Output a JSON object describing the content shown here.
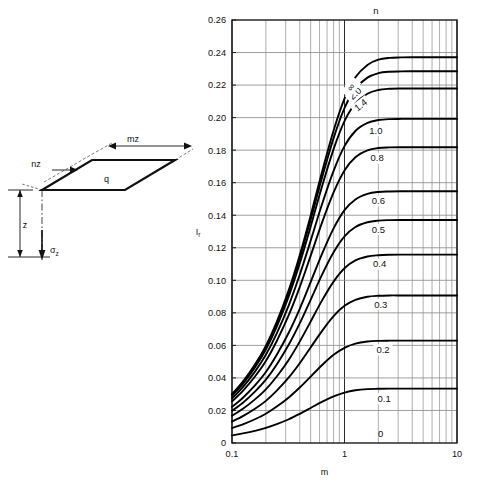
{
  "figure": {
    "type": "influence-chart",
    "sketch": {
      "label_q": "q",
      "label_mz": "mz",
      "label_nz": "nz",
      "label_z": "z",
      "label_sigma": "σ",
      "label_sigma_sub": "z"
    },
    "chart_title_top": "n"
  },
  "chart_data": {
    "type": "line",
    "title": "",
    "subtitle": "",
    "xlabel": "m",
    "ylabel": "I",
    "ylabel_sub": "r",
    "xscale": "log",
    "xlim": [
      0.1,
      10
    ],
    "ylim": [
      0,
      0.26
    ],
    "grid": true,
    "legend_position": "inline-curve-labels",
    "legend_title": "n",
    "xticks": [
      0.1,
      1,
      10
    ],
    "xtick_labels": [
      "0.1",
      "1",
      "10"
    ],
    "x_minor_ticks": [
      0.2,
      0.3,
      0.4,
      0.5,
      0.6,
      0.7,
      0.8,
      0.9,
      2,
      3,
      4,
      5,
      6,
      7,
      8,
      9
    ],
    "yticks": [
      0,
      0.02,
      0.04,
      0.06,
      0.08,
      0.1,
      0.12,
      0.14,
      0.16,
      0.18,
      0.2,
      0.22,
      0.24,
      0.26
    ],
    "ytick_labels": [
      "0",
      "0.02",
      "0.04",
      "0.06",
      "0.08",
      "0.10",
      "0.12",
      "0.14",
      "0.16",
      "0.18",
      "0.20",
      "0.22",
      "0.24",
      "0.26"
    ],
    "x": [
      0.1,
      0.125,
      0.16,
      0.2,
      0.25,
      0.32,
      0.4,
      0.5,
      0.63,
      0.8,
      1.0,
      1.25,
      1.6,
      2.0,
      2.5,
      3.2,
      4.0,
      5.0,
      6.3,
      8.0,
      10.0
    ],
    "series": [
      {
        "name": "0.1",
        "label": "0.1",
        "values": [
          0.0047,
          0.0059,
          0.0075,
          0.0093,
          0.0116,
          0.0146,
          0.0179,
          0.0215,
          0.0253,
          0.0287,
          0.031,
          0.0324,
          0.0331,
          0.0333,
          0.0334,
          0.0334,
          0.0334,
          0.0334,
          0.0334,
          0.0334,
          0.0334
        ]
      },
      {
        "name": "0.2",
        "label": "0.2",
        "values": [
          0.0092,
          0.0115,
          0.0146,
          0.018,
          0.0224,
          0.028,
          0.0341,
          0.0408,
          0.0478,
          0.0542,
          0.0585,
          0.0611,
          0.0624,
          0.0628,
          0.0629,
          0.0629,
          0.0629,
          0.0629,
          0.0629,
          0.0629,
          0.0629
        ]
      },
      {
        "name": "0.3",
        "label": "0.3",
        "values": [
          0.0132,
          0.0165,
          0.021,
          0.0259,
          0.0322,
          0.0403,
          0.049,
          0.0587,
          0.0688,
          0.078,
          0.0843,
          0.088,
          0.0899,
          0.0905,
          0.0907,
          0.0907,
          0.0907,
          0.0907,
          0.0907,
          0.0907,
          0.0907
        ]
      },
      {
        "name": "0.4",
        "label": "0.4",
        "values": [
          0.0168,
          0.021,
          0.0268,
          0.033,
          0.0409,
          0.0512,
          0.0623,
          0.0746,
          0.0875,
          0.0992,
          0.1074,
          0.1122,
          0.1146,
          0.1154,
          0.1157,
          0.1158,
          0.1158,
          0.1158,
          0.1158,
          0.1158,
          0.1158
        ]
      },
      {
        "name": "0.5",
        "label": "0.5",
        "values": [
          0.0198,
          0.0248,
          0.0316,
          0.0389,
          0.0483,
          0.0605,
          0.0735,
          0.088,
          0.1033,
          0.1172,
          0.127,
          0.1328,
          0.1357,
          0.1367,
          0.137,
          0.1371,
          0.1371,
          0.1371,
          0.1371,
          0.1371,
          0.1371
        ]
      },
      {
        "name": "0.6",
        "label": "0.6",
        "values": [
          0.0222,
          0.0278,
          0.0354,
          0.0436,
          0.0542,
          0.0679,
          0.0825,
          0.0989,
          0.1161,
          0.1319,
          0.1431,
          0.1497,
          0.1531,
          0.1543,
          0.1546,
          0.1547,
          0.1547,
          0.1547,
          0.1547,
          0.1547,
          0.1547
        ]
      },
      {
        "name": "0.8",
        "label": "0.8",
        "values": [
          0.0256,
          0.0321,
          0.0409,
          0.0504,
          0.0627,
          0.0787,
          0.0958,
          0.115,
          0.1353,
          0.154,
          0.1675,
          0.1756,
          0.1798,
          0.1813,
          0.1817,
          0.1818,
          0.1818,
          0.1818,
          0.1818,
          0.1818,
          0.1818
        ]
      },
      {
        "name": "1.0",
        "label": "1.0",
        "values": [
          0.0274,
          0.0344,
          0.0439,
          0.0542,
          0.0674,
          0.0848,
          0.1034,
          0.1243,
          0.1466,
          0.1673,
          0.1825,
          0.1918,
          0.1967,
          0.1985,
          0.1991,
          0.1992,
          0.1992,
          0.1992,
          0.1992,
          0.1992,
          0.1992
        ]
      },
      {
        "name": "1.4",
        "label": "1.4",
        "values": [
          0.029,
          0.0364,
          0.0465,
          0.0575,
          0.0716,
          0.0903,
          0.1103,
          0.133,
          0.1575,
          0.1806,
          0.1978,
          0.2087,
          0.2147,
          0.217,
          0.2177,
          0.2179,
          0.2179,
          0.2179,
          0.2179,
          0.2179,
          0.2179
        ]
      },
      {
        "name": "2.0",
        "label": "2.0",
        "values": [
          0.0297,
          0.0373,
          0.0477,
          0.059,
          0.0735,
          0.0928,
          0.1136,
          0.1372,
          0.1629,
          0.1874,
          0.2058,
          0.2178,
          0.2246,
          0.2273,
          0.2282,
          0.2284,
          0.2285,
          0.2285,
          0.2285,
          0.2285,
          0.2285
        ]
      },
      {
        "name": "inf",
        "label": "∞",
        "values": [
          0.03,
          0.0377,
          0.0482,
          0.0597,
          0.0744,
          0.0941,
          0.1154,
          0.1397,
          0.1664,
          0.1921,
          0.2117,
          0.2248,
          0.2324,
          0.2356,
          0.2367,
          0.237,
          0.2371,
          0.2371,
          0.2371,
          0.2371,
          0.2371
        ]
      }
    ],
    "baseline_label": "0",
    "annotations": [
      {
        "text": "n",
        "role": "series-group-title"
      }
    ]
  }
}
